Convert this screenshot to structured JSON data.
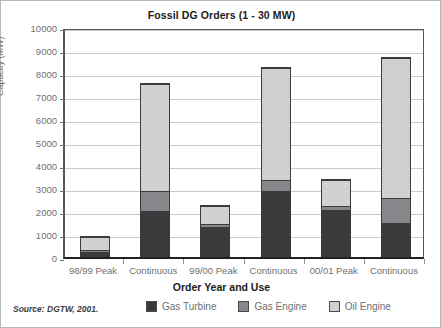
{
  "chart_data": {
    "type": "bar",
    "subtype": "stacked",
    "title": "Fossil DG Orders (1 - 30 MW)",
    "xlabel": "Order Year and Use",
    "ylabel": "Capacity (MW)",
    "categories": [
      "98/99 Peak",
      "Continuous",
      "99/00 Peak",
      "Continuous",
      "00/01 Peak",
      "Continuous"
    ],
    "series": [
      {
        "name": "Gas Turbine",
        "color": "#3a3a3c",
        "values": [
          220,
          2000,
          1350,
          2900,
          2050,
          1500
        ]
      },
      {
        "name": "Gas Engine",
        "color": "#86878a",
        "values": [
          80,
          900,
          120,
          450,
          200,
          1100
        ]
      },
      {
        "name": "Oil Engine",
        "color": "#cfd0d1",
        "values": [
          600,
          4650,
          780,
          4900,
          1150,
          6100
        ]
      }
    ],
    "totals": [
      900,
      7550,
      2250,
      8250,
      3400,
      8700
    ],
    "ylim": [
      0,
      10000
    ],
    "yticks": [
      0,
      1000,
      2000,
      3000,
      4000,
      5000,
      6000,
      7000,
      8000,
      9000,
      10000
    ],
    "ytick_labels": [
      "0",
      "1000",
      "2000",
      "3000",
      "4000",
      "5000",
      "6000",
      "7000",
      "8000",
      "9000",
      "10000"
    ],
    "grid": true,
    "legend_position": "bottom"
  },
  "legend": {
    "items": [
      {
        "label": "Gas Turbine",
        "color": "#3a3a3c"
      },
      {
        "label": "Gas Engine",
        "color": "#86878a"
      },
      {
        "label": "Oil Engine",
        "color": "#cfd0d1"
      }
    ]
  },
  "footer": {
    "source": "Source: DGTW, 2001."
  }
}
